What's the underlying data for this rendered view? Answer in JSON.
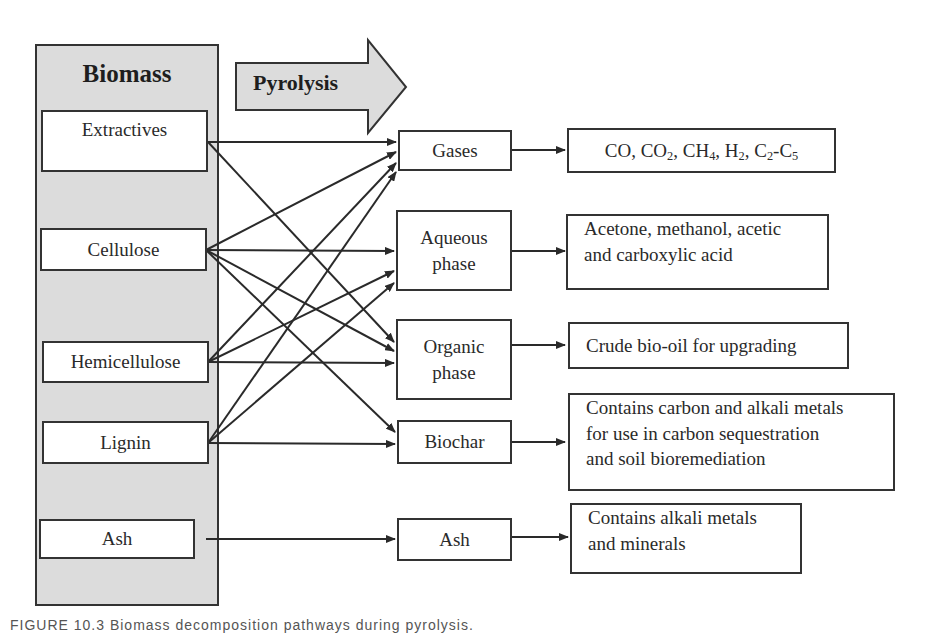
{
  "diagram": {
    "source_panel": {
      "title": "Biomass",
      "items": [
        {
          "id": "extractives",
          "label": "Extractives"
        },
        {
          "id": "cellulose",
          "label": "Cellulose"
        },
        {
          "id": "hemicellulose",
          "label": "Hemicellulose"
        },
        {
          "id": "lignin",
          "label": "Lignin"
        },
        {
          "id": "ash",
          "label": "Ash"
        }
      ]
    },
    "process_arrow": {
      "label": "Pyrolysis"
    },
    "products": [
      {
        "id": "gases",
        "label": "Gases"
      },
      {
        "id": "aqueous",
        "label_line1": "Aqueous",
        "label_line2": "phase"
      },
      {
        "id": "organic",
        "label_line1": "Organic",
        "label_line2": "phase"
      },
      {
        "id": "biochar",
        "label": "Biochar"
      },
      {
        "id": "ash",
        "label": "Ash"
      }
    ],
    "descriptions": {
      "gases": {
        "parts": [
          "CO, CO",
          "2",
          ", CH",
          "4",
          ", H",
          "2",
          ", C",
          "2",
          "-C",
          "5"
        ]
      },
      "aqueous": {
        "line1": "Acetone, methanol, acetic",
        "line2": "and carboxylic acid"
      },
      "organic": {
        "line1": "Crude bio-oil for upgrading"
      },
      "biochar": {
        "line1": "Contains carbon and alkali metals",
        "line2": "for use in carbon sequestration",
        "line3": "and soil bioremediation"
      },
      "ash": {
        "line1": "Contains alkali metals",
        "line2": "and minerals"
      }
    },
    "connections": [
      {
        "from": "extractives",
        "to": "gases"
      },
      {
        "from": "extractives",
        "to": "organic"
      },
      {
        "from": "cellulose",
        "to": "gases"
      },
      {
        "from": "cellulose",
        "to": "aqueous"
      },
      {
        "from": "cellulose",
        "to": "organic"
      },
      {
        "from": "cellulose",
        "to": "biochar"
      },
      {
        "from": "hemicellulose",
        "to": "gases"
      },
      {
        "from": "hemicellulose",
        "to": "aqueous"
      },
      {
        "from": "hemicellulose",
        "to": "organic"
      },
      {
        "from": "lignin",
        "to": "gases"
      },
      {
        "from": "lignin",
        "to": "aqueous"
      },
      {
        "from": "lignin",
        "to": "biochar"
      },
      {
        "from": "ash",
        "to": "ash"
      }
    ],
    "colors": {
      "panel_fill": "#dcdcdc",
      "stroke": "#333333",
      "box_fill": "#ffffff"
    }
  },
  "caption": "FIGURE 10.3   Biomass decomposition pathways during pyrolysis."
}
